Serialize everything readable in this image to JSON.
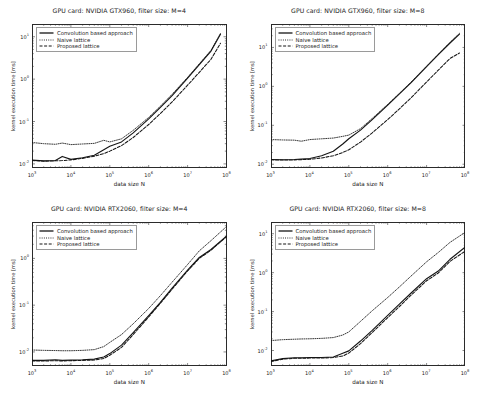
{
  "figure": {
    "n_rows": 2,
    "n_cols": 2,
    "background": "#ffffff",
    "axis_color": "#2b2b2b",
    "text_color": "#1a1a1a"
  },
  "common": {
    "xlabel": "data size N",
    "ylabel": "kernel execution time [ms]",
    "legend": [
      {
        "label": "Convolution based approach",
        "style": "solid",
        "key": "line-solid-icon"
      },
      {
        "label": "Naive lattice",
        "style": "dotted",
        "key": "line-dotted-icon"
      },
      {
        "label": "Proposed lattice",
        "style": "dashed",
        "key": "line-dashed-icon"
      }
    ],
    "xticks": [
      "10³",
      "10⁴",
      "10⁵",
      "10⁶",
      "10⁷",
      "10⁸"
    ],
    "xtick_exponents": [
      3,
      4,
      5,
      6,
      7,
      8
    ],
    "xlim": [
      1000,
      100000000
    ]
  },
  "chart_data": [
    {
      "id": "gtx960-m4",
      "type": "line",
      "title": "GPU card: NVIDIA GTX960, filter size: M=4",
      "xlabel": "data size N",
      "ylabel": "kernel execution time [ms]",
      "xscale": "log",
      "yscale": "log",
      "xlim": [
        1000,
        100000000
      ],
      "ylim": [
        0.008,
        20
      ],
      "yticks": [
        "10¹",
        "10⁰",
        "10⁻¹",
        "10⁻²"
      ],
      "ytick_exponents": [
        1,
        0,
        -1,
        -2
      ],
      "grid": false,
      "legend_position": "upper left",
      "x": [
        1000,
        2000,
        4000,
        6000,
        10000,
        20000,
        40000,
        70000,
        100000,
        200000,
        400000,
        1000000,
        2000000,
        4000000,
        10000000,
        20000000,
        40000000,
        70000000
      ],
      "series": [
        {
          "name": "Convolution based approach",
          "style": "solid",
          "values": [
            0.0123,
            0.0118,
            0.012,
            0.015,
            0.0128,
            0.014,
            0.016,
            0.0215,
            0.026,
            0.033,
            0.054,
            0.115,
            0.215,
            0.41,
            1.05,
            2.2,
            4.6,
            11.5
          ]
        },
        {
          "name": "Naive lattice",
          "style": "dotted",
          "values": [
            0.032,
            0.03,
            0.029,
            0.031,
            0.0285,
            0.0295,
            0.0305,
            0.036,
            0.033,
            0.039,
            0.062,
            0.125,
            0.23,
            0.44,
            1.1,
            2.3,
            4.8,
            12.0
          ]
        },
        {
          "name": "Proposed lattice",
          "style": "dashed",
          "values": [
            0.012,
            0.0116,
            0.0118,
            0.012,
            0.0124,
            0.0135,
            0.0152,
            0.0175,
            0.02,
            0.027,
            0.042,
            0.085,
            0.155,
            0.29,
            0.72,
            1.45,
            2.95,
            7.0
          ]
        }
      ]
    },
    {
      "id": "gtx960-m8",
      "type": "line",
      "title": "GPU card: NVIDIA GTX960, filter size: M=8",
      "xlabel": "data size N",
      "ylabel": "kernel execution time [ms]",
      "xscale": "log",
      "yscale": "log",
      "xlim": [
        1000,
        100000000
      ],
      "ylim": [
        0.008,
        40
      ],
      "yticks": [
        "10¹",
        "10⁰",
        "10⁻¹",
        "10⁻²"
      ],
      "ytick_exponents": [
        1,
        0,
        -1,
        -2
      ],
      "grid": false,
      "legend_position": "upper left",
      "x": [
        1000,
        2000,
        4000,
        6000,
        10000,
        20000,
        40000,
        70000,
        100000,
        200000,
        400000,
        1000000,
        2000000,
        4000000,
        10000000,
        20000000,
        40000000,
        70000000
      ],
      "series": [
        {
          "name": "Convolution based approach",
          "style": "solid",
          "values": [
            0.0132,
            0.013,
            0.0132,
            0.0135,
            0.014,
            0.0165,
            0.0215,
            0.033,
            0.045,
            0.075,
            0.14,
            0.33,
            0.64,
            1.25,
            3.2,
            6.5,
            13.0,
            22.0
          ]
        },
        {
          "name": "Naive lattice",
          "style": "dotted",
          "values": [
            0.043,
            0.042,
            0.0415,
            0.039,
            0.043,
            0.045,
            0.047,
            0.052,
            0.056,
            0.082,
            0.15,
            0.345,
            0.66,
            1.3,
            3.3,
            6.7,
            13.5,
            23.0
          ]
        },
        {
          "name": "Proposed lattice",
          "style": "dashed",
          "values": [
            0.013,
            0.0128,
            0.0129,
            0.0131,
            0.0134,
            0.0145,
            0.0165,
            0.02,
            0.0235,
            0.037,
            0.064,
            0.14,
            0.265,
            0.51,
            1.3,
            2.6,
            5.2,
            7.2
          ]
        }
      ]
    },
    {
      "id": "rtx2060-m4",
      "type": "line",
      "title": "GPU card: NVIDIA RTX2060, filter size: M=4",
      "xlabel": "data size N",
      "ylabel": "kernel execution time [ms]",
      "xscale": "log",
      "yscale": "log",
      "xlim": [
        1000,
        100000000
      ],
      "ylim": [
        0.005,
        6
      ],
      "yticks": [
        "10⁰",
        "10⁻¹",
        "10⁻²"
      ],
      "ytick_exponents": [
        0,
        -1,
        -2
      ],
      "grid": false,
      "legend_position": "upper left",
      "x": [
        1000,
        2000,
        4000,
        6000,
        10000,
        20000,
        40000,
        70000,
        100000,
        200000,
        400000,
        1000000,
        2000000,
        4000000,
        10000000,
        20000000,
        40000000,
        100000000
      ],
      "series": [
        {
          "name": "Convolution based approach",
          "style": "solid",
          "values": [
            0.0066,
            0.0066,
            0.0068,
            0.0066,
            0.0067,
            0.0068,
            0.007,
            0.0078,
            0.0092,
            0.014,
            0.026,
            0.06,
            0.115,
            0.23,
            0.56,
            1.05,
            1.55,
            3.0
          ]
        },
        {
          "name": "Naive lattice",
          "style": "dotted",
          "values": [
            0.011,
            0.0108,
            0.0107,
            0.0106,
            0.0106,
            0.0108,
            0.0112,
            0.013,
            0.016,
            0.0235,
            0.04,
            0.085,
            0.16,
            0.31,
            0.74,
            1.45,
            2.4,
            4.8
          ]
        },
        {
          "name": "Proposed lattice",
          "style": "dashed",
          "values": [
            0.0064,
            0.0064,
            0.0065,
            0.0064,
            0.0065,
            0.0066,
            0.0067,
            0.0072,
            0.0085,
            0.0125,
            0.0235,
            0.056,
            0.11,
            0.22,
            0.54,
            1.0,
            1.5,
            2.9
          ]
        }
      ]
    },
    {
      "id": "rtx2060-m8",
      "type": "line",
      "title": "GPU card: NVIDIA RTX2060, filter size: M=8",
      "xlabel": "data size N",
      "ylabel": "kernel execution time [ms]",
      "xscale": "log",
      "yscale": "log",
      "xlim": [
        1000,
        100000000
      ],
      "ylim": [
        0.004,
        20
      ],
      "yticks": [
        "10¹",
        "10⁰",
        "10⁻¹",
        "10⁻²"
      ],
      "ytick_exponents": [
        1,
        0,
        -1,
        -2
      ],
      "grid": false,
      "legend_position": "upper left",
      "x": [
        1000,
        2000,
        4000,
        6000,
        10000,
        20000,
        40000,
        70000,
        100000,
        200000,
        400000,
        1000000,
        2000000,
        4000000,
        10000000,
        20000000,
        40000000,
        100000000
      ],
      "series": [
        {
          "name": "Convolution based approach",
          "style": "solid",
          "values": [
            0.0054,
            0.0062,
            0.0065,
            0.0065,
            0.0066,
            0.0066,
            0.0068,
            0.0085,
            0.0098,
            0.0175,
            0.033,
            0.08,
            0.155,
            0.3,
            0.7,
            1.1,
            2.2,
            4.6
          ]
        },
        {
          "name": "Naive lattice",
          "style": "dotted",
          "values": [
            0.018,
            0.019,
            0.0195,
            0.0198,
            0.02,
            0.0205,
            0.0215,
            0.025,
            0.03,
            0.056,
            0.105,
            0.23,
            0.43,
            0.82,
            1.9,
            3.3,
            6.0,
            11.0
          ]
        },
        {
          "name": "Proposed lattice",
          "style": "dashed",
          "values": [
            0.0052,
            0.006,
            0.0063,
            0.0063,
            0.0064,
            0.0064,
            0.0066,
            0.0072,
            0.0086,
            0.015,
            0.029,
            0.07,
            0.135,
            0.265,
            0.62,
            0.98,
            1.95,
            3.6
          ]
        }
      ]
    }
  ]
}
